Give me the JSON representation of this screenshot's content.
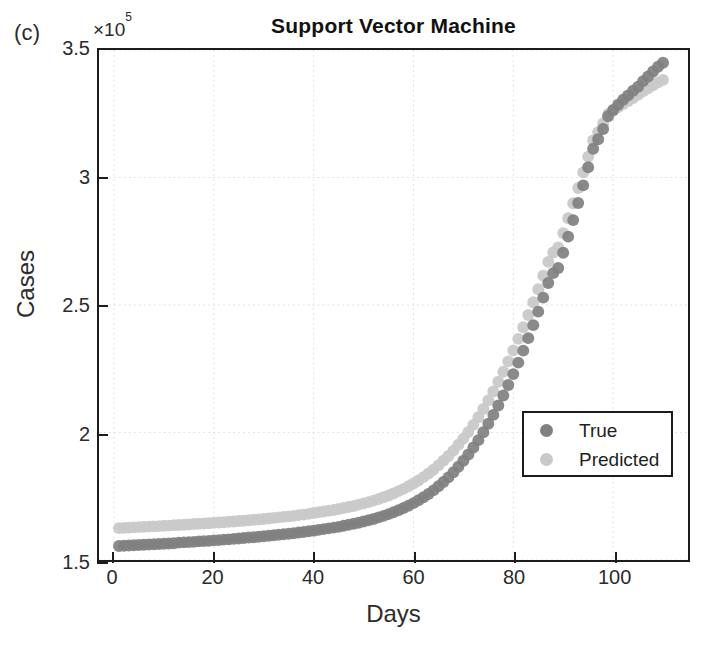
{
  "figure": {
    "panel_label": "(c)",
    "title": "Support Vector Machine",
    "y_multiplier_prefix": "×10",
    "y_multiplier_exponent": "5"
  },
  "legend": {
    "position": "inside-right-middle",
    "entries": [
      {
        "label": "True",
        "color": "#808080",
        "marker": "circle"
      },
      {
        "label": "Predicted",
        "color": "#c9c9c9",
        "marker": "circle"
      }
    ]
  },
  "colors": {
    "true_series": "#808080",
    "predicted_series": "#c9c9c9",
    "axis": "#1c1c1c",
    "grid": "#e2e2e2",
    "text": "#2b2b2b",
    "background": "#ffffff"
  },
  "chart_data": {
    "type": "scatter",
    "title": "Support Vector Machine",
    "xlabel": "Days",
    "ylabel": "Cases",
    "y_multiplier": 100000,
    "xlim": [
      -3,
      115
    ],
    "ylim": [
      1.5,
      3.5
    ],
    "xticks": [
      0,
      20,
      40,
      60,
      80,
      100
    ],
    "yticks": [
      1.5,
      2,
      2.5,
      3,
      3.5
    ],
    "xtick_labels": [
      "0",
      "20",
      "40",
      "60",
      "80",
      "100"
    ],
    "ytick_labels": [
      "1.5",
      "2",
      "2.5",
      "3",
      "3.5"
    ],
    "grid": true,
    "legend_position": "center right",
    "x": [
      1,
      2,
      3,
      4,
      5,
      6,
      7,
      8,
      9,
      10,
      11,
      12,
      13,
      14,
      15,
      16,
      17,
      18,
      19,
      20,
      21,
      22,
      23,
      24,
      25,
      26,
      27,
      28,
      29,
      30,
      31,
      32,
      33,
      34,
      35,
      36,
      37,
      38,
      39,
      40,
      41,
      42,
      43,
      44,
      45,
      46,
      47,
      48,
      49,
      50,
      51,
      52,
      53,
      54,
      55,
      56,
      57,
      58,
      59,
      60,
      61,
      62,
      63,
      64,
      65,
      66,
      67,
      68,
      69,
      70,
      71,
      72,
      73,
      74,
      75,
      76,
      77,
      78,
      79,
      80,
      81,
      82,
      83,
      84,
      85,
      86,
      87,
      88,
      89,
      90,
      91,
      92,
      93,
      94,
      95,
      96,
      97,
      98,
      99,
      100,
      101,
      102,
      103,
      104,
      105,
      106,
      107,
      108,
      109,
      110
    ],
    "series": [
      {
        "name": "True",
        "color": "#808080",
        "values": [
          1.555,
          1.556,
          1.557,
          1.558,
          1.559,
          1.56,
          1.561,
          1.562,
          1.563,
          1.564,
          1.565,
          1.566,
          1.568,
          1.569,
          1.57,
          1.571,
          1.573,
          1.574,
          1.575,
          1.577,
          1.578,
          1.58,
          1.581,
          1.583,
          1.584,
          1.586,
          1.588,
          1.589,
          1.591,
          1.593,
          1.595,
          1.597,
          1.599,
          1.601,
          1.603,
          1.605,
          1.608,
          1.61,
          1.613,
          1.615,
          1.618,
          1.621,
          1.624,
          1.627,
          1.63,
          1.634,
          1.638,
          1.642,
          1.646,
          1.651,
          1.656,
          1.661,
          1.667,
          1.673,
          1.68,
          1.687,
          1.695,
          1.704,
          1.713,
          1.723,
          1.734,
          1.746,
          1.759,
          1.773,
          1.789,
          1.806,
          1.824,
          1.844,
          1.866,
          1.889,
          1.914,
          1.941,
          1.97,
          2.001,
          2.034,
          2.069,
          2.106,
          2.145,
          2.186,
          2.229,
          2.274,
          2.321,
          2.37,
          2.421,
          2.474,
          2.529,
          2.586,
          2.625,
          2.645,
          2.705,
          2.768,
          2.833,
          2.9,
          2.969,
          3.04,
          3.113,
          3.15,
          3.19,
          3.24,
          3.265,
          3.285,
          3.305,
          3.322,
          3.34,
          3.356,
          3.378,
          3.396,
          3.416,
          3.434,
          3.45
        ]
      },
      {
        "name": "Predicted",
        "color": "#c9c9c9",
        "values": [
          1.625,
          1.626,
          1.627,
          1.628,
          1.629,
          1.63,
          1.631,
          1.632,
          1.633,
          1.634,
          1.635,
          1.636,
          1.637,
          1.638,
          1.639,
          1.641,
          1.642,
          1.643,
          1.644,
          1.646,
          1.647,
          1.648,
          1.65,
          1.651,
          1.653,
          1.654,
          1.656,
          1.658,
          1.659,
          1.661,
          1.663,
          1.665,
          1.667,
          1.669,
          1.671,
          1.673,
          1.676,
          1.678,
          1.681,
          1.684,
          1.687,
          1.69,
          1.693,
          1.696,
          1.7,
          1.704,
          1.708,
          1.712,
          1.717,
          1.722,
          1.727,
          1.733,
          1.739,
          1.746,
          1.753,
          1.761,
          1.77,
          1.779,
          1.789,
          1.8,
          1.812,
          1.825,
          1.839,
          1.854,
          1.871,
          1.889,
          1.908,
          1.929,
          1.952,
          1.976,
          2.002,
          2.03,
          2.06,
          2.092,
          2.126,
          2.161,
          2.199,
          2.238,
          2.279,
          2.322,
          2.367,
          2.413,
          2.461,
          2.511,
          2.562,
          2.615,
          2.669,
          2.706,
          2.726,
          2.782,
          2.84,
          2.899,
          2.959,
          3.02,
          3.082,
          3.145,
          3.178,
          3.212,
          3.248,
          3.262,
          3.275,
          3.288,
          3.3,
          3.312,
          3.324,
          3.338,
          3.35,
          3.362,
          3.373,
          3.383
        ]
      }
    ]
  }
}
